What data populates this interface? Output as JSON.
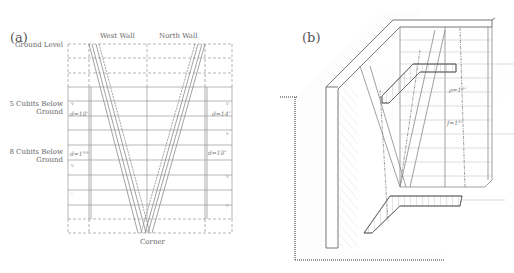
{
  "panel_a": {
    "label": "(a)",
    "columns": {
      "west": "West Wall",
      "north": "North Wall"
    },
    "row_labels": {
      "ground": "Ground Level",
      "five_cubits_l1": "5 Cubits Below",
      "five_cubits_l2": "Ground",
      "eight_cubits_l1": "8 Cubits Below",
      "eight_cubits_l2": "Ground"
    },
    "annotations": {
      "left_upper": "d=18″",
      "left_lower": "d=1°°′",
      "right_upper": "d=14″",
      "right_lower": "d=18″"
    },
    "bottom": "Corner"
  },
  "panel_b": {
    "label": "(b)",
    "annotations": {
      "upper": "ρ=1°″",
      "lower": "f=1°″"
    }
  }
}
